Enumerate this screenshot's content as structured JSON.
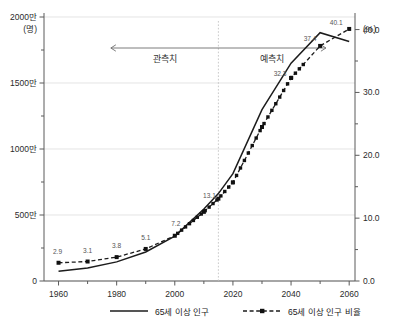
{
  "chart_data": {
    "type": "line",
    "title": "",
    "xlabel": "",
    "ylabel": "",
    "grid": true,
    "legend_position": "bottom",
    "x": [
      1960,
      1970,
      1980,
      1990,
      2000,
      2010,
      2015,
      2020,
      2030,
      2040,
      2050,
      2060
    ],
    "xlim": [
      1955,
      2062
    ],
    "xticks": [
      1960,
      1980,
      2000,
      2020,
      2040,
      2060
    ],
    "xtick_labels": [
      "1960",
      "1980",
      "2000",
      "2020",
      "2040",
      "2060"
    ],
    "xminor_ticks": [
      1970,
      1990,
      2010,
      2030,
      2050
    ],
    "left_axis": {
      "unit": "(명)",
      "ylim": [
        0,
        20000000
      ],
      "ticks": [
        0,
        5000000,
        10000000,
        15000000,
        20000000
      ],
      "tick_labels": [
        "0",
        "500만",
        "1000만",
        "1500만",
        "2000만"
      ],
      "minor_ticks": [
        2500000,
        7500000,
        12500000,
        17500000
      ]
    },
    "right_axis": {
      "unit": "(%)",
      "ylim": [
        0,
        42
      ],
      "ticks": [
        0,
        10,
        20,
        30,
        40
      ],
      "tick_labels": [
        "0.0",
        "10.0",
        "20.0",
        "30.0",
        "40.0"
      ],
      "minor_ticks": [
        5,
        15,
        25,
        35
      ]
    },
    "series": [
      {
        "name": "65세 이상 인구",
        "style": "solid",
        "axis": "left",
        "values": [
          730000,
          990000,
          1450000,
          2200000,
          3400000,
          5450000,
          6620000,
          8130000,
          12980000,
          16500000,
          18810000,
          18150000
        ]
      },
      {
        "name": "65세 이상 인구 비율",
        "style": "dashed-markers",
        "axis": "right",
        "values": [
          2.9,
          3.1,
          3.8,
          5.1,
          7.2,
          11.0,
          13.1,
          15.7,
          24.5,
          32.3,
          37.4,
          40.1
        ]
      }
    ],
    "data_labels": [
      {
        "x": 1960,
        "value": "2.9"
      },
      {
        "x": 1970,
        "value": "3.1"
      },
      {
        "x": 1980,
        "value": "3.8"
      },
      {
        "x": 1990,
        "value": "5.1"
      },
      {
        "x": 2000,
        "value": "7.2"
      },
      {
        "x": 2015,
        "value": "13.1"
      },
      {
        "x": 2040,
        "value": "32.3"
      },
      {
        "x": 2050,
        "value": "37.4"
      },
      {
        "x": 2060,
        "value": "40.1"
      }
    ],
    "annotations": {
      "divider_x": 2015,
      "observed_label": "관측치",
      "forecast_label": "예측치",
      "arrow_from": 1978,
      "arrow_to": 2052
    }
  },
  "legend": {
    "items": [
      {
        "label": "65세 이상 인구",
        "style": "solid"
      },
      {
        "label": "65세 이상 인구 비율",
        "style": "dashed-markers"
      }
    ]
  },
  "colors": {
    "series": "#1c1c1c",
    "grid": "#d9d9d9",
    "axis": "#5a5a5a",
    "label": "#555555"
  }
}
